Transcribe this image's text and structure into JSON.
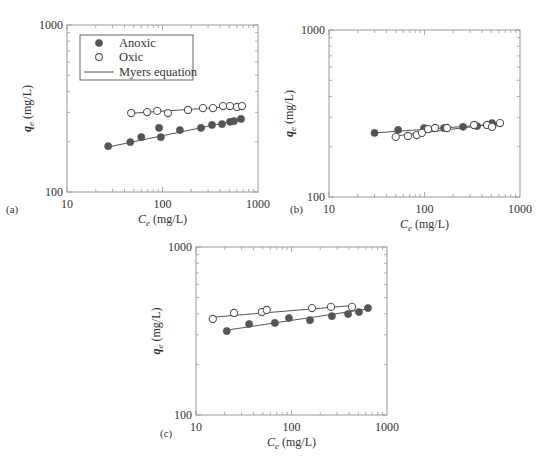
{
  "figure": {
    "panel_labels": [
      "(a)",
      "(b)",
      "(c)"
    ],
    "xlabel_main": "C",
    "xlabel_sub": "e",
    "xlabel_unit": " (mg/L)",
    "ylabel_main": "q",
    "ylabel_sub": "e",
    "ylabel_unit": " (mg/L)",
    "x_ticks": [
      "10",
      "100",
      "1000"
    ],
    "y_ticks": [
      "100",
      "1000"
    ],
    "legend": {
      "anoxic": "Anoxic",
      "oxic": "Oxic",
      "fit": "Myers equation"
    },
    "colors": {
      "anoxic": "#555555",
      "oxic_edge": "#555555",
      "line": "#555555",
      "axis": "#999999"
    }
  },
  "chart_data": [
    {
      "panel": "(a)",
      "type": "scatter",
      "xscale": "log",
      "yscale": "log",
      "xlim": [
        10,
        1000
      ],
      "ylim": [
        100,
        1000
      ],
      "xlabel": "Ce (mg/L)",
      "ylabel": "qe (mg/L)",
      "legend_position": "upper left",
      "series": [
        {
          "name": "Anoxic",
          "marker": "filled-circle",
          "x": [
            27,
            46,
            60,
            92,
            96,
            152,
            253,
            330,
            420,
            509,
            561,
            664
          ],
          "y": [
            188,
            199,
            213,
            242,
            213,
            235,
            242,
            252,
            255,
            263,
            266,
            274
          ]
        },
        {
          "name": "Oxic",
          "marker": "open-circle",
          "x": [
            47,
            69,
            88,
            114,
            185,
            265,
            338,
            430,
            509,
            603,
            680
          ],
          "y": [
            297,
            301,
            306,
            297,
            310,
            318,
            318,
            327,
            327,
            323,
            327
          ]
        }
      ],
      "fits": [
        {
          "name": "Myers equation (Anoxic)",
          "x": [
            27,
            664
          ],
          "y": [
            186,
            272
          ]
        },
        {
          "name": "Myers equation (Oxic)",
          "x": [
            47,
            680
          ],
          "y": [
            296,
            328
          ]
        }
      ]
    },
    {
      "panel": "(b)",
      "type": "scatter",
      "xscale": "log",
      "yscale": "log",
      "xlim": [
        10,
        1000
      ],
      "ylim": [
        100,
        1000
      ],
      "xlabel": "Ce (mg/L)",
      "ylabel": "qe (mg/L)",
      "series": [
        {
          "name": "Anoxic",
          "marker": "filled-circle",
          "x": [
            30,
            53,
            99,
            160,
            253,
            355,
            509,
            521
          ],
          "y": [
            242,
            252,
            259,
            259,
            263,
            266,
            277,
            270
          ]
        },
        {
          "name": "Oxic",
          "marker": "open-circle",
          "x": [
            50,
            67,
            83,
            94,
            109,
            129,
            172,
            330,
            451,
            509,
            618
          ],
          "y": [
            229,
            232,
            235,
            242,
            255,
            259,
            259,
            270,
            270,
            263,
            277
          ]
        }
      ],
      "fits": [
        {
          "name": "Myers equation (Anoxic)",
          "x": [
            30,
            521
          ],
          "y": [
            242,
            272
          ]
        },
        {
          "name": "Myers equation (Oxic)",
          "x": [
            50,
            618
          ],
          "y": [
            232,
            276
          ]
        }
      ]
    },
    {
      "panel": "(c)",
      "type": "scatter",
      "xscale": "log",
      "yscale": "log",
      "xlim": [
        10,
        1000
      ],
      "ylim": [
        100,
        1000
      ],
      "xlabel": "Ce (mg/L)",
      "ylabel": "qe (mg/L)",
      "series": [
        {
          "name": "Anoxic",
          "marker": "filled-circle",
          "x": [
            21,
            36,
            67,
            94,
            156,
            265,
            391,
            509,
            632
          ],
          "y": [
            316,
            348,
            353,
            378,
            367,
            388,
            399,
            410,
            433
          ]
        },
        {
          "name": "Oxic",
          "marker": "open-circle",
          "x": [
            15,
            25,
            49,
            55,
            164,
            259,
            430
          ],
          "y": [
            373,
            405,
            410,
            422,
            433,
            440,
            440
          ]
        }
      ],
      "fits": [
        {
          "name": "Myers equation (Anoxic)",
          "x": [
            21,
            632
          ],
          "y": [
            320,
            428
          ]
        },
        {
          "name": "Myers equation (Oxic)",
          "x": [
            15,
            430
          ],
          "y": [
            382,
            448
          ]
        }
      ]
    }
  ]
}
